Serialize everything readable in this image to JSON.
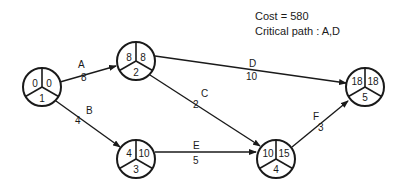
{
  "info": {
    "cost_text": "Cost = 580",
    "critical_path_text": "Critical  path : A,D"
  },
  "nodes": [
    {
      "id": "1",
      "cx": 42,
      "cy": 87,
      "earliest": "0",
      "latest": "0",
      "label": "1"
    },
    {
      "id": "2",
      "cx": 136,
      "cy": 61,
      "earliest": "8",
      "latest": "8",
      "label": "2"
    },
    {
      "id": "3",
      "cx": 136,
      "cy": 159,
      "earliest": "4",
      "latest": "10",
      "label": "3"
    },
    {
      "id": "4",
      "cx": 276,
      "cy": 159,
      "earliest": "10",
      "latest": "15",
      "label": "4"
    },
    {
      "id": "5",
      "cx": 365,
      "cy": 87,
      "earliest": "18",
      "latest": "18",
      "label": "5"
    }
  ],
  "activities": [
    {
      "name": "A",
      "duration": "8",
      "from": "1",
      "to": "2"
    },
    {
      "name": "B",
      "duration": "4",
      "from": "1",
      "to": "3"
    },
    {
      "name": "C",
      "duration": "2",
      "from": "2",
      "to": "4"
    },
    {
      "name": "D",
      "duration": "10",
      "from": "2",
      "to": "5"
    },
    {
      "name": "E",
      "duration": "5",
      "from": "3",
      "to": "4"
    },
    {
      "name": "F",
      "duration": "3",
      "from": "4",
      "to": "5"
    }
  ],
  "colors": {
    "stroke": "#1a1a1a",
    "background": "#ffffff"
  }
}
